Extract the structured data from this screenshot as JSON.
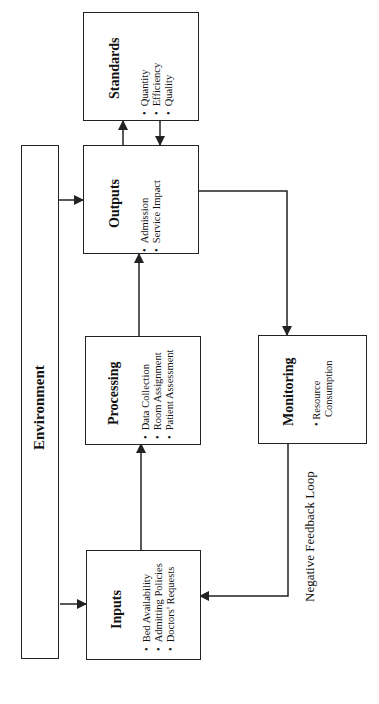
{
  "diagram": {
    "environment": {
      "title": "Environment"
    },
    "standards": {
      "title": "Standards",
      "items": [
        "Quantity",
        "Efficiency",
        "Quality"
      ]
    },
    "outputs": {
      "title": "Outputs",
      "items": [
        "Admission",
        "Service Impact"
      ]
    },
    "processing": {
      "title": "Processing",
      "items": [
        "Data Collection",
        "Room Assignment",
        "Patient Assessment"
      ]
    },
    "inputs": {
      "title": "Inputs",
      "items": [
        "Bed Availability",
        "Admitting Policies",
        "Doctors' Requests"
      ]
    },
    "monitoring": {
      "title": "Monitoring",
      "items": [
        "Resource Consumption"
      ],
      "item_lines": [
        "Resource",
        "Consumption"
      ]
    },
    "feedback_label": "Negative Feedback Loop",
    "colors": {
      "line": "#222222",
      "background": "#ffffff"
    }
  }
}
